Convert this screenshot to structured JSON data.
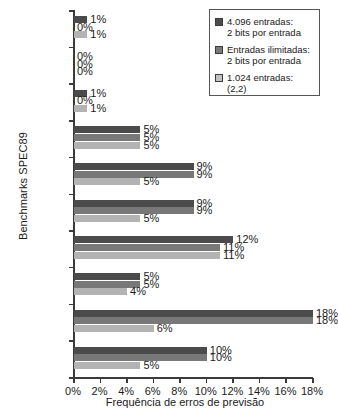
{
  "chart_data": {
    "type": "bar",
    "orientation": "horizontal",
    "title": "",
    "xlabel": "Frequência de erros de previsão",
    "ylabel": "Benchmarks SPEC89",
    "xlim": [
      0,
      18
    ],
    "xticks": [
      "0%",
      "2%",
      "4%",
      "6%",
      "8%",
      "10%",
      "12%",
      "14%",
      "16%",
      "18%"
    ],
    "xtick_values": [
      0,
      2,
      4,
      6,
      8,
      10,
      12,
      14,
      16,
      18
    ],
    "grid": false,
    "legend_position": "top-right",
    "categories": [
      "nASA7",
      "matrix300",
      "tomcatv",
      "doduc",
      "spice",
      "fpppp",
      "gcc",
      "espresso",
      "eqntott",
      "li"
    ],
    "series": [
      {
        "name": "4.096 entradas: 2 bits por entrada",
        "color": "#4b4b4b",
        "values": [
          1,
          0,
          1,
          5,
          9,
          9,
          12,
          5,
          18,
          10
        ],
        "labels": [
          "1%",
          "0%",
          "1%",
          "5%",
          "9%",
          "9%",
          "12%",
          "5%",
          "18%",
          "10%"
        ]
      },
      {
        "name": "Entradas ilimitadas: 2 bits por entrada",
        "color": "#787878",
        "values": [
          0,
          0,
          0,
          5,
          9,
          9,
          11,
          5,
          18,
          10
        ],
        "labels": [
          "0%",
          "0%",
          "0%",
          "5%",
          "9%",
          "9%",
          "11%",
          "5%",
          "18%",
          "10%"
        ]
      },
      {
        "name": "1.024 entradas: (2,2)",
        "color": "#b3b3b3",
        "values": [
          1,
          0,
          1,
          5,
          5,
          5,
          11,
          4,
          6,
          5
        ],
        "labels": [
          "1%",
          "0%",
          "1%",
          "5%",
          "5%",
          "5%",
          "11%",
          "4%",
          "6%",
          "5%"
        ]
      }
    ]
  },
  "legend": {
    "items": [
      {
        "swatch": "dark-gray-swatch",
        "line1": "4.096 entradas:",
        "line2": "2 bits por entrada"
      },
      {
        "swatch": "medium-gray-swatch",
        "line1": "Entradas ilimitadas:",
        "line2": "2 bits por entrada"
      },
      {
        "swatch": "light-gray-swatch",
        "line1": "1.024 entradas:",
        "line2": "(2,2)"
      }
    ]
  }
}
